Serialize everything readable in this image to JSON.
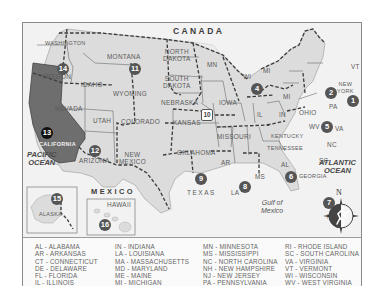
{
  "map": {
    "country_label": "CANADA",
    "mexico_label": "MEXICO",
    "pacific_label": "PACIFIC\nOCEAN",
    "atlantic_label": "ATLANTIC\nOCEAN",
    "gulf_label": "Gulf of\nMexico",
    "compass_label": "N",
    "highlighted_state": "CALIFORNIA",
    "colors": {
      "land": "#dcdcdc",
      "highlight": "#6e6e6e",
      "water": "#f2f2f2",
      "badge": "#555555",
      "badge_highlight": "#111111",
      "border": "#3a3a3a"
    },
    "states": [
      {
        "name": "WASHINGTON"
      },
      {
        "name": "OREGON"
      },
      {
        "name": "IDAHO"
      },
      {
        "name": "MONTANA"
      },
      {
        "name": "WYOMING"
      },
      {
        "name": "NEVADA"
      },
      {
        "name": "CALIFORNIA"
      },
      {
        "name": "UTAH"
      },
      {
        "name": "COLORADO"
      },
      {
        "name": "ARIZONA"
      },
      {
        "name": "NEW\nMEXICO"
      },
      {
        "name": "NORTH\nDAKOTA"
      },
      {
        "name": "SOUTH\nDAKOTA"
      },
      {
        "name": "NEBRASKA"
      },
      {
        "name": "KANSAS"
      },
      {
        "name": "OKLAHOMA"
      },
      {
        "name": "TEXAS"
      },
      {
        "name": "MN"
      },
      {
        "name": "IOWA"
      },
      {
        "name": "MISSOURI"
      },
      {
        "name": "AR"
      },
      {
        "name": "LA"
      },
      {
        "name": "WI"
      },
      {
        "name": "IL"
      },
      {
        "name": "MI"
      },
      {
        "name": "MI"
      },
      {
        "name": "IN"
      },
      {
        "name": "OHIO"
      },
      {
        "name": "KENTUCKY"
      },
      {
        "name": "TENNESSEE"
      },
      {
        "name": "MS"
      },
      {
        "name": "AL"
      },
      {
        "name": "GEORGIA"
      },
      {
        "name": "FL"
      },
      {
        "name": "SC"
      },
      {
        "name": "NC"
      },
      {
        "name": "WV"
      },
      {
        "name": "VA"
      },
      {
        "name": "PA"
      },
      {
        "name": "NEW\nYORK"
      },
      {
        "name": "VT"
      },
      {
        "name": "ME"
      },
      {
        "name": "NH"
      },
      {
        "name": "MA"
      },
      {
        "name": "RI"
      },
      {
        "name": "CT"
      },
      {
        "name": "NJ"
      },
      {
        "name": "DE"
      },
      {
        "name": "MD"
      },
      {
        "name": "ALASKA"
      },
      {
        "name": "HAWAII"
      }
    ],
    "regions": [
      "1",
      "2",
      "3",
      "4",
      "5",
      "6",
      "7",
      "8",
      "9",
      "10",
      "11",
      "12",
      "13",
      "14",
      "15",
      "16"
    ]
  },
  "legend": {
    "columns": [
      [
        "AL - ALABAMA",
        "AR - ARKANSAS",
        "CT - CONNECTICUT",
        "DE - DELAWARE",
        "FL - FLORIDA",
        "IL - ILLINOIS"
      ],
      [
        "IN - INDIANA",
        "LA - LOUISIANA",
        "MA - MASSACHUSETTS",
        "MD - MARYLAND",
        "ME - MAINE",
        "MI - MICHIGAN"
      ],
      [
        "MN - MINNESOTA",
        "MS - MISSISSIPPI",
        "NC - NORTH CAROLINA",
        "NH - NEW HAMPSHIRE",
        "NJ - NEW JERSEY",
        "PA - PENNSYLVANIA"
      ],
      [
        "RI - RHODE ISLAND",
        "SC - SOUTH CAROLINA",
        "VA - VIRGINIA",
        "VT - VERMONT",
        "WI - WISCONSIN",
        "WV - WEST VIRGINIA"
      ]
    ]
  }
}
